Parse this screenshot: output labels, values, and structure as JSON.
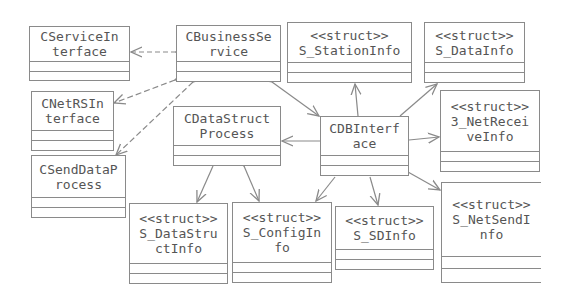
{
  "diagram": {
    "type": "uml-class-diagram",
    "colors": {
      "line": "#8a8a8a",
      "text": "#555555",
      "background": "#ffffff"
    },
    "classes": [
      {
        "id": "CServiceInterface",
        "stereotype": "",
        "line1": "CServiceIn",
        "line2": "terface",
        "line3": ""
      },
      {
        "id": "CBusinessService",
        "stereotype": "",
        "line1": "CBusinessSe",
        "line2": "rvice",
        "line3": ""
      },
      {
        "id": "S_StationInfo",
        "stereotype": "<<struct>>",
        "line1": "S_StationInfo",
        "line2": "",
        "line3": ""
      },
      {
        "id": "S_DataInfo",
        "stereotype": "<<struct>>",
        "line1": "S_DataInfo",
        "line2": "",
        "line3": ""
      },
      {
        "id": "CNetRSInterface",
        "stereotype": "",
        "line1": "CNetRSIn",
        "line2": "terface",
        "line3": ""
      },
      {
        "id": "CDataStructProcess",
        "stereotype": "",
        "line1": "CDataStruct",
        "line2": "Process",
        "line3": ""
      },
      {
        "id": "CDBInterface",
        "stereotype": "",
        "line1": "CDBInterf",
        "line2": "ace",
        "line3": ""
      },
      {
        "id": "S_NetReceiveInfo",
        "stereotype": "<<struct>>",
        "line1": "3_NetRecei",
        "line2": "veInfo",
        "line3": ""
      },
      {
        "id": "CSendDataProcess",
        "stereotype": "",
        "line1": "CSendDataP",
        "line2": "rocess",
        "line3": ""
      },
      {
        "id": "S_DataStructInfo",
        "stereotype": "<<struct>>",
        "line1": "S_DataStru",
        "line2": "ctInfo",
        "line3": ""
      },
      {
        "id": "S_ConfigInfo",
        "stereotype": "<<struct>>",
        "line1": "S_ConfigIn",
        "line2": "fo",
        "line3": ""
      },
      {
        "id": "S_SDInfo",
        "stereotype": "<<struct>>",
        "line1": "S_SDInfo",
        "line2": "",
        "line3": ""
      },
      {
        "id": "S_NetSendInfo",
        "stereotype": "<<struct>>",
        "line1": "S_NetSendI",
        "line2": "nfo",
        "line3": ""
      }
    ],
    "relations": [
      {
        "from": "CBusinessService",
        "to": "CServiceInterface",
        "kind": "aggregation-dashed"
      },
      {
        "from": "CBusinessService",
        "to": "CNetRSInterface",
        "kind": "aggregation-dashed"
      },
      {
        "from": "CBusinessService",
        "to": "CSendDataProcess",
        "kind": "aggregation-dashed"
      },
      {
        "from": "CBusinessService",
        "to": "CDBInterface",
        "kind": "aggregation"
      },
      {
        "from": "CDBInterface",
        "to": "S_StationInfo",
        "kind": "association"
      },
      {
        "from": "CDBInterface",
        "to": "S_DataInfo",
        "kind": "association"
      },
      {
        "from": "CDBInterface",
        "to": "S_NetReceiveInfo",
        "kind": "association"
      },
      {
        "from": "CDBInterface",
        "to": "S_NetSendInfo",
        "kind": "association"
      },
      {
        "from": "CDBInterface",
        "to": "S_SDInfo",
        "kind": "association"
      },
      {
        "from": "CDBInterface",
        "to": "S_ConfigInfo",
        "kind": "association"
      },
      {
        "from": "CDBInterface",
        "to": "CDataStructProcess",
        "kind": "association"
      },
      {
        "from": "CDataStructProcess",
        "to": "S_DataStructInfo",
        "kind": "association"
      },
      {
        "from": "CDataStructProcess",
        "to": "S_ConfigInfo",
        "kind": "aggregation"
      }
    ]
  }
}
